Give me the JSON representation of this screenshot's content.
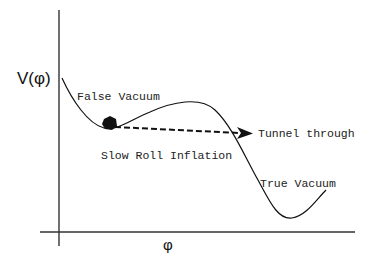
{
  "diagram": {
    "type": "potential-energy-landscape",
    "axes": {
      "y_label": "V(φ)",
      "x_label": "φ"
    },
    "labels": {
      "false_vacuum": "False Vacuum",
      "tunnel": "Tunnel through",
      "slow_roll": "Slow Roll Inflation",
      "true_vacuum": "True Vacuum"
    },
    "colors": {
      "line": "#111111",
      "axis": "#333333",
      "background": "#ffffff"
    }
  }
}
